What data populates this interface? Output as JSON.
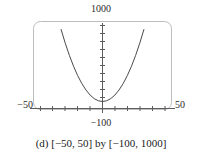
{
  "figure": {
    "caption": "(d) [−50, 50] by [−100, 1000]",
    "labels": {
      "y_max": "1000",
      "y_min": "−100",
      "x_min": "−50",
      "x_max": "50"
    },
    "colors": {
      "frame": "#b9b9b9",
      "axis": "#5a5a5a",
      "curve": "#4a4a4a",
      "text": "#1a1a1a",
      "background": "#ffffff"
    }
  },
  "chart_data": {
    "type": "line",
    "title": "(d) [−50, 50] by [−100, 1000]",
    "xlabel": "",
    "ylabel": "",
    "xlim": [
      -50,
      50
    ],
    "ylim": [
      -100,
      1000
    ],
    "grid": false,
    "legend": null,
    "axis_labels": {
      "left": "−50",
      "right": "50",
      "top": "1000",
      "bottom": "−100"
    },
    "xticks": [
      -40,
      -30,
      -20,
      -10,
      0,
      10,
      20,
      30,
      40
    ],
    "yticks": [
      100,
      200,
      300,
      400,
      500,
      600,
      700,
      800,
      900
    ],
    "tick_labels_shown": false,
    "series": [
      {
        "name": "y = x²",
        "expression": "x^2",
        "x": [
          -32,
          -30,
          -27,
          -24,
          -21,
          -18,
          -15,
          -12,
          -9,
          -6,
          -3,
          0,
          3,
          6,
          9,
          12,
          15,
          18,
          21,
          24,
          27,
          30,
          32
        ],
        "y": [
          1024,
          900,
          729,
          576,
          441,
          324,
          225,
          144,
          81,
          36,
          9,
          0,
          9,
          36,
          81,
          144,
          225,
          324,
          441,
          576,
          729,
          900,
          1024
        ]
      }
    ],
    "annotations": [
      {
        "text": "vertex at origin",
        "x": 0,
        "y": 0
      }
    ]
  }
}
